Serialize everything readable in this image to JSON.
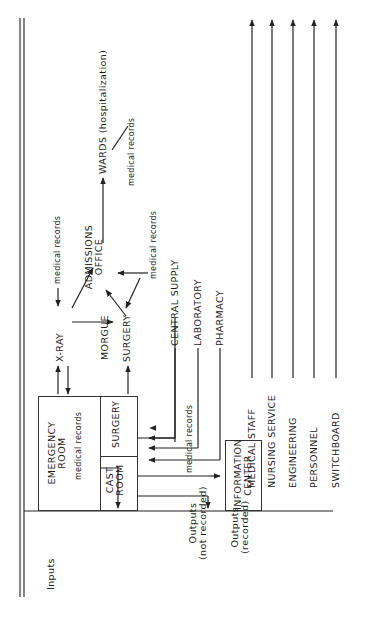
{
  "diagram": {
    "orientation": "rotated 90 degrees counter-clockwise",
    "row_labels": {
      "inputs": "Inputs",
      "outputs_not_recorded_1": "Outputs",
      "outputs_not_recorded_2": "(not recorded)",
      "outputs_recorded_1": "Outputs",
      "outputs_recorded_2": "(recorded)"
    },
    "nodes": {
      "emergency_room_1": "EMERGENCY",
      "emergency_room_2": "ROOM",
      "er_medical_records": "medical records",
      "cast_room_1": "CAST",
      "cast_room_2": "ROOM",
      "er_surgery": "SURGERY",
      "xray": "X-RAY",
      "morgue": "MORGUE",
      "surgery": "SURGERY",
      "admissions_1": "ADMISSIONS",
      "admissions_2": "OFFICE",
      "wards": "WARDS (hospitalization)",
      "central_supply": "CENTRAL SUPPLY",
      "laboratory": "LABORATORY",
      "pharmacy": "PHARMACY",
      "information_center_1": "INFORMATION",
      "information_center_2": "CENTER"
    },
    "edge_labels": {
      "xray_medical_records": "medical records",
      "wards_medical_records": "medical records",
      "admissions_medical_records": "medical records",
      "info_medical_records": "medical records"
    },
    "departments": [
      {
        "label": "MEDICAL STAFF"
      },
      {
        "label": "NURSING SERVICE"
      },
      {
        "label": "ENGINEERING"
      },
      {
        "label": "PERSONNEL"
      },
      {
        "label": "SWITCHBOARD"
      }
    ],
    "line_color": "#222222"
  }
}
